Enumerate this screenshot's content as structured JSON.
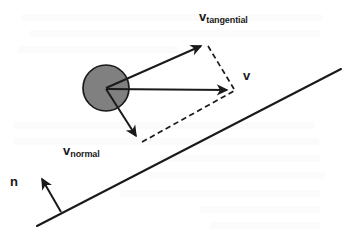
{
  "figure": {
    "background_color": "#ffffff",
    "stroke_color": "#1a1a1a",
    "ball_fill_color": "#808080",
    "ball_stroke_color": "#1a1a1a"
  },
  "labels": {
    "v_tangential": {
      "symbol": "v",
      "subscript": "tangential"
    },
    "v_resultant": {
      "symbol": "v",
      "subscript": ""
    },
    "v_normal": {
      "symbol": "v",
      "subscript": "normal"
    },
    "surface_normal": {
      "symbol": "n",
      "subscript": ""
    }
  },
  "geometry": {
    "ball": {
      "cx": 106,
      "cy": 88,
      "r": 23
    },
    "incline": {
      "x1": 37,
      "y1": 226,
      "x2": 341,
      "y2": 69
    },
    "vector_v_tangential": {
      "x1": 106,
      "y1": 88,
      "x2": 204,
      "y2": 44
    },
    "vector_v_resultant": {
      "x1": 106,
      "y1": 89,
      "x2": 231,
      "y2": 90
    },
    "vector_v_normal": {
      "x1": 106,
      "y1": 89,
      "x2": 139,
      "y2": 141
    },
    "vector_surface_normal": {
      "x1": 61,
      "y1": 212,
      "x2": 40,
      "y2": 175
    },
    "dashed_tangential_to_v": {
      "x1": 208,
      "y1": 46,
      "x2": 234,
      "y2": 89
    },
    "dashed_normal_to_v": {
      "x1": 142,
      "y1": 142,
      "x2": 234,
      "y2": 91
    }
  }
}
